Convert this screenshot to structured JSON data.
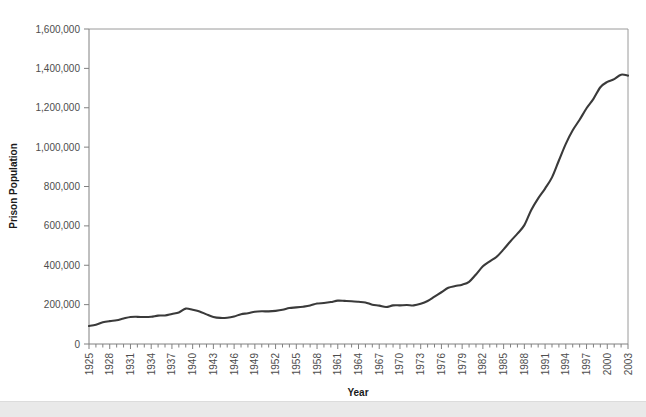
{
  "chart_data": {
    "type": "line",
    "title": "",
    "xlabel": "Year",
    "ylabel": "Prison Population",
    "xlim": [
      1925,
      2003
    ],
    "ylim": [
      0,
      1600000
    ],
    "grid": false,
    "legend": "none",
    "y_ticks": [
      0,
      200000,
      400000,
      600000,
      800000,
      1000000,
      1200000,
      1400000,
      1600000
    ],
    "y_tick_labels": [
      "0",
      "200,000",
      "400,000",
      "600,000",
      "800,000",
      "1,000,000",
      "1,200,000",
      "1,400,000",
      "1,600,000"
    ],
    "x_tick_labels": [
      "1925",
      "1928",
      "1931",
      "1934",
      "1937",
      "1940",
      "1943",
      "1946",
      "1949",
      "1952",
      "1955",
      "1958",
      "1961",
      "1964",
      "1967",
      "1970",
      "1973",
      "1976",
      "1979",
      "1982",
      "1985",
      "1988",
      "1991",
      "1994",
      "1997",
      "2000",
      "2003"
    ],
    "x_tick_interval_years": 3,
    "x_minor_tick_interval_years": 1,
    "series": [
      {
        "name": "Prison Population",
        "color": "#3a3a3a",
        "x": [
          1925,
          1926,
          1927,
          1928,
          1929,
          1930,
          1931,
          1932,
          1933,
          1934,
          1935,
          1936,
          1937,
          1938,
          1939,
          1940,
          1941,
          1942,
          1943,
          1944,
          1945,
          1946,
          1947,
          1948,
          1949,
          1950,
          1951,
          1952,
          1953,
          1954,
          1955,
          1956,
          1957,
          1958,
          1959,
          1960,
          1961,
          1962,
          1963,
          1964,
          1965,
          1966,
          1967,
          1968,
          1969,
          1970,
          1971,
          1972,
          1973,
          1974,
          1975,
          1976,
          1977,
          1978,
          1979,
          1980,
          1981,
          1982,
          1983,
          1984,
          1985,
          1986,
          1987,
          1988,
          1989,
          1990,
          1991,
          1992,
          1993,
          1994,
          1995,
          1996,
          1997,
          1998,
          1999,
          2000,
          2001,
          2002,
          2003
        ],
        "values": [
          91669,
          97991,
          109983,
          116390,
          120496,
          129453,
          137082,
          137997,
          136810,
          138316,
          144180,
          145038,
          152741,
          160285,
          179818,
          173706,
          165439,
          150384,
          137220,
          132456,
          133649,
          140079,
          151304,
          155977,
          163749,
          166123,
          165680,
          168233,
          173579,
          182901,
          185780,
          189565,
          195414,
          205643,
          208105,
          212953,
          220149,
          218830,
          217283,
          214336,
          210895,
          199654,
          194896,
          187914,
          196007,
          196441,
          198061,
          196092,
          204211,
          218466,
          240593,
          262833,
          285456,
          294396,
          301470,
          315974,
          353167,
          394374,
          419820,
          443398,
          480568,
          522084,
          560812,
          603732,
          680907,
          739980,
          789610,
          846277,
          932074,
          1016691,
          1085363,
          1138984,
          1197590,
          1245402,
          1304074,
          1331278,
          1345217,
          1367856,
          1363000
        ]
      }
    ]
  },
  "axis": {
    "y_title": "Prison Population",
    "x_title": "Year"
  }
}
